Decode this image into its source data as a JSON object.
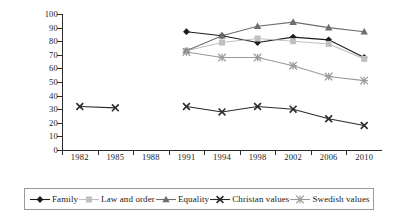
{
  "chart_data": {
    "type": "line",
    "title": "",
    "xlabel": "",
    "ylabel": "",
    "ylim": [
      0,
      100
    ],
    "ytick_step": 10,
    "grid": false,
    "legend_position": "bottom",
    "categories": [
      "1982",
      "1985",
      "1988",
      "1991",
      "1994",
      "1998",
      "2002",
      "2006",
      "2010"
    ],
    "yticks": [
      "0",
      "10",
      "20",
      "30",
      "40",
      "50",
      "60",
      "70",
      "80",
      "90",
      "100"
    ],
    "series": [
      {
        "name": "Family",
        "marker": "diamond",
        "color": "#1c1c1c",
        "values": [
          null,
          null,
          null,
          87,
          84,
          79,
          83,
          81,
          68
        ]
      },
      {
        "name": "Law and order",
        "marker": "square",
        "color": "#c0c0c0",
        "values": [
          null,
          null,
          null,
          73,
          79,
          82,
          80,
          78,
          67
        ]
      },
      {
        "name": "Equality",
        "marker": "triangle",
        "color": "#6e6e6e",
        "values": [
          null,
          null,
          null,
          73,
          84,
          91,
          94,
          90,
          87
        ]
      },
      {
        "name": "Christan values",
        "marker": "cross",
        "color": "#2b2b2b",
        "values": [
          32,
          31,
          null,
          32,
          28,
          32,
          30,
          23,
          18
        ]
      },
      {
        "name": "Swedish values",
        "marker": "asterisk",
        "color": "#9a9a9a",
        "values": [
          null,
          null,
          null,
          72,
          68,
          68,
          62,
          54,
          51
        ]
      }
    ]
  }
}
